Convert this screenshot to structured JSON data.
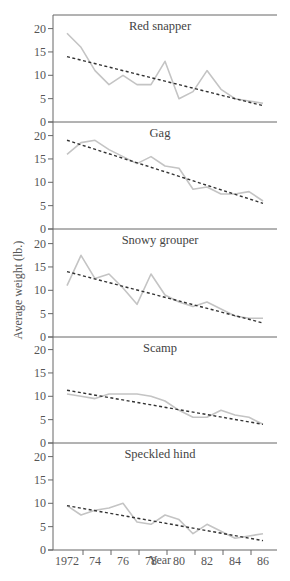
{
  "chart_data": {
    "type": "line",
    "layout": "five vertically stacked panels sharing x axis",
    "xlabel": "Year",
    "ylabel": "Average weight (lb.)",
    "x_tick_labels": [
      "1972",
      "74",
      "76",
      "78",
      "80",
      "82",
      "84",
      "86"
    ],
    "y_tick_labels": [
      "0",
      "5",
      "10",
      "15",
      "20"
    ],
    "ylim": [
      0,
      22
    ],
    "xlim": [
      1971,
      1987
    ],
    "grid": false,
    "legend": "none (solid gray = observed, dashed black = linear trend)",
    "x": [
      1972,
      1973,
      1974,
      1975,
      1976,
      1977,
      1978,
      1979,
      1980,
      1981,
      1982,
      1983,
      1984,
      1985,
      1986
    ],
    "panels": [
      {
        "title": "Red snapper",
        "observed": [
          19,
          16,
          11,
          8,
          10,
          8,
          8,
          13,
          5,
          6.5,
          11,
          7,
          5,
          4.5,
          4
        ],
        "extra_point_note": "spike to ~6.5 near 1985.5",
        "trend": [
          14,
          3.5
        ]
      },
      {
        "title": "Gag",
        "observed": [
          16,
          18.5,
          19,
          17,
          15.5,
          14,
          15.5,
          13.5,
          13,
          8.5,
          9,
          7.5,
          7.5,
          8,
          6
        ],
        "trend": [
          19,
          5.5
        ]
      },
      {
        "title": "Snowy grouper",
        "observed": [
          11,
          17.5,
          12.5,
          13.5,
          10.5,
          7,
          13.5,
          9,
          7.5,
          6.5,
          7.5,
          6,
          4.5,
          4,
          4
        ],
        "trend": [
          14,
          3
        ]
      },
      {
        "title": "Scamp",
        "observed": [
          10.5,
          10,
          9.5,
          10.5,
          10.5,
          10.5,
          10,
          9,
          7,
          5.5,
          5.5,
          7,
          6,
          5.5,
          4
        ],
        "trend": [
          11.3,
          4
        ]
      },
      {
        "title": "Speckled hind",
        "observed": [
          9.5,
          7.5,
          8.5,
          9,
          10,
          6,
          5.5,
          7.5,
          6.5,
          3.5,
          5.5,
          4,
          2.5,
          3,
          3.5
        ],
        "trend": [
          9.5,
          2
        ]
      }
    ]
  },
  "colors": {
    "observed_line": "#c4c4c4",
    "trend_line": "#333333",
    "axis": "#666666",
    "text": "#555555"
  }
}
